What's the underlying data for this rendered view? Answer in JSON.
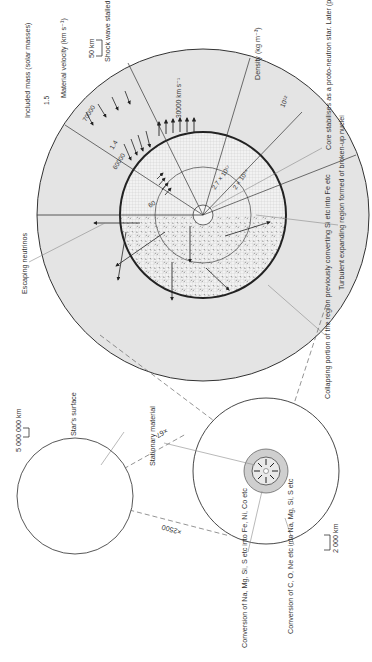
{
  "diagram": {
    "orientation": "rotated 90 degrees counter-clockwise",
    "colors": {
      "outer_shell": "#e4e4e4",
      "inner_core_grid": "#ececec",
      "line": "#333333",
      "leader": "#8a8a8a",
      "background": "#ffffff"
    },
    "panel_star": {
      "scale_bar": "5 000 000 km",
      "labels": {
        "surface": "Star's surface"
      },
      "magnification": "×2500"
    },
    "panel_core": {
      "scale_bar": "2 000 km",
      "labels": {
        "stationary": "Stationary material",
        "na_mg": "Conversion of Na, Mg, Si, S etc into Fe, Ni, Co etc",
        "c_o_ne": "Conversion of C, O, Ne etc into Na, Mg, Si, S etc"
      },
      "magnification": "×67"
    },
    "panel_collapse": {
      "scale_bar": "50 km",
      "column_headers": {
        "mass": "Included mass (solar masses)",
        "velocity": "Material velocity (km s⁻¹)",
        "shock": "Shock wave stalled at about 150 km",
        "density": "Density (kg m⁻³)"
      },
      "values": {
        "mass_outer": "1.5",
        "mass_inner": "1.4",
        "vel_outer": "70000",
        "vel_inner": "60000",
        "vel_core": "60",
        "shock_speed": "30000 km s⁻¹",
        "density_outer": "10¹²",
        "density_mid": "2 × 10¹⁴",
        "density_inner": "2.7 × 10¹⁷"
      },
      "labels": {
        "neutrinos": "Escaping neutrinos",
        "turbulent": "Turbulent expanding region formed of broken-up nuclei",
        "protoneutron": "Core stabilises as a proto-neutron star. Later (perhaps) to become a pulsar. In some cases it may eventually collapse down to a black hole",
        "collapsing": "Collapsing portion of the region previously converting Si etc into Fe etc"
      }
    }
  }
}
